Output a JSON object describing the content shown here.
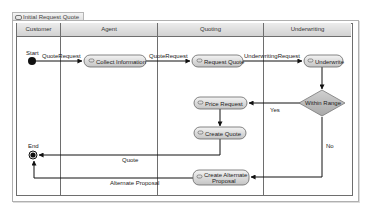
{
  "diagram": {
    "title": "Initial Request Quote",
    "title_icon": "activity-diagram-icon",
    "lanes": [
      {
        "name": "Customer"
      },
      {
        "name": "Agent"
      },
      {
        "name": "Quoting"
      },
      {
        "name": "Underwriting"
      }
    ],
    "nodes": {
      "start": {
        "label": "Start",
        "type": "initial"
      },
      "collect_information": {
        "label": "Collect Information",
        "type": "action",
        "lane": "Agent"
      },
      "request_quote": {
        "label": "Request Quote",
        "type": "action",
        "lane": "Quoting"
      },
      "underwrite": {
        "label": "Underwrite",
        "type": "action",
        "lane": "Underwriting"
      },
      "within_range": {
        "label": "Within Range",
        "type": "decision",
        "lane": "Underwriting"
      },
      "price_request": {
        "label": "Price Request",
        "type": "action",
        "lane": "Quoting"
      },
      "create_quote": {
        "label": "Create Quote",
        "type": "action",
        "lane": "Quoting"
      },
      "create_alternate_proposal": {
        "label_line1": "Create Alternate",
        "label_line2": "Proposal",
        "type": "action",
        "lane": "Quoting"
      },
      "end": {
        "label": "End",
        "type": "final"
      }
    },
    "edges": {
      "start_to_collect": "QuoteRequest",
      "collect_to_request": "QuoteRequest",
      "request_to_underwrite": "UnderwritingRequest",
      "decision_yes": "Yes",
      "decision_no": "No",
      "quote_to_end": "Quote",
      "alt_to_end": "Alternate Proposal"
    },
    "colors": {
      "node_fill_top": "#f2f2f2",
      "node_fill_bottom": "#c8c8c8",
      "decision_fill": "#b9b9b9",
      "line": "#1a1a1a",
      "lane_border": "#6e6e6e"
    }
  }
}
